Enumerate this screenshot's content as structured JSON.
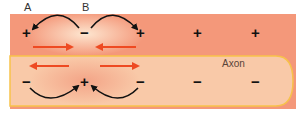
{
  "labels": {
    "point_a": "A",
    "point_b": "B",
    "axon": "Axon"
  },
  "colors": {
    "extracellular": "#f4987a",
    "axon_fill": "#f9c9a8",
    "membrane_line": "#f7c24a",
    "depolarized_glow": "#fbe0c8",
    "current_arrow": "#ee4a22",
    "charge_symbol": "#111111"
  },
  "outside_charges": [
    {
      "symbol": "+",
      "x": 27,
      "y": 33
    },
    {
      "symbol": "−",
      "x": 85,
      "y": 33
    },
    {
      "symbol": "+",
      "x": 141,
      "y": 33
    },
    {
      "symbol": "+",
      "x": 198,
      "y": 33
    },
    {
      "symbol": "+",
      "x": 256,
      "y": 33
    }
  ],
  "inside_charges": [
    {
      "symbol": "−",
      "x": 27,
      "y": 82
    },
    {
      "symbol": "+",
      "x": 85,
      "y": 82
    },
    {
      "symbol": "−",
      "x": 141,
      "y": 82
    },
    {
      "symbol": "−",
      "x": 198,
      "y": 82
    },
    {
      "symbol": "−",
      "x": 256,
      "y": 82
    }
  ]
}
